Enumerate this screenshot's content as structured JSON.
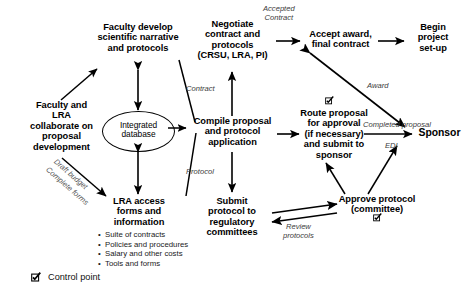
{
  "diagram": {
    "nodes": {
      "faculty_collaborate": "Faculty and\nLRA\ncollaborate on\nproposal\ndevelopment",
      "faculty_develop": "Faculty develop\nscientific narrative\nand protocols",
      "integrated_database": "Integrated\ndatabase",
      "lra_access": "LRA access\nforms and\ninformation",
      "negotiate": "Negotiate\ncontract and\nprotocols\n(CRSU, LRA, PI)",
      "compile": "Compile proposal\nand protocol\napplication",
      "submit_protocol": "Submit\nprotocol to\nregulatory\ncommittees",
      "accept_award": "Accept award,\nfinal contract",
      "begin_project": "Begin\nproject\nset-up",
      "route_proposal": "Route proposal\nfor approval\n(if necessary)\nand submit to\nsponsor",
      "sponsor": "Sponsor",
      "approve_protocol": "Approve protocol\n(committee)"
    },
    "bullets": [
      "Suite of contracts",
      "Policies and procedures",
      "Salary and other costs",
      "Tools and forms"
    ],
    "edge_labels": {
      "draft_budget": "Draft budget",
      "complete_forms": "Complete forms",
      "contract": "Contract",
      "protocol": "Protocol",
      "accepted_contract_1": "Accepted",
      "accepted_contract_2": "Contract",
      "award": "Award",
      "completed_proposal": "Completed proposal",
      "edi": "EDI",
      "review_protocols_1": "Review",
      "review_protocols_2": "protocols"
    },
    "legend": {
      "icon": "control-point-checkbox-icon",
      "label": "Control point"
    },
    "colors": {
      "stroke": "#000000",
      "text": "#000000",
      "edge_label": "#555555",
      "background": "#ffffff"
    }
  }
}
